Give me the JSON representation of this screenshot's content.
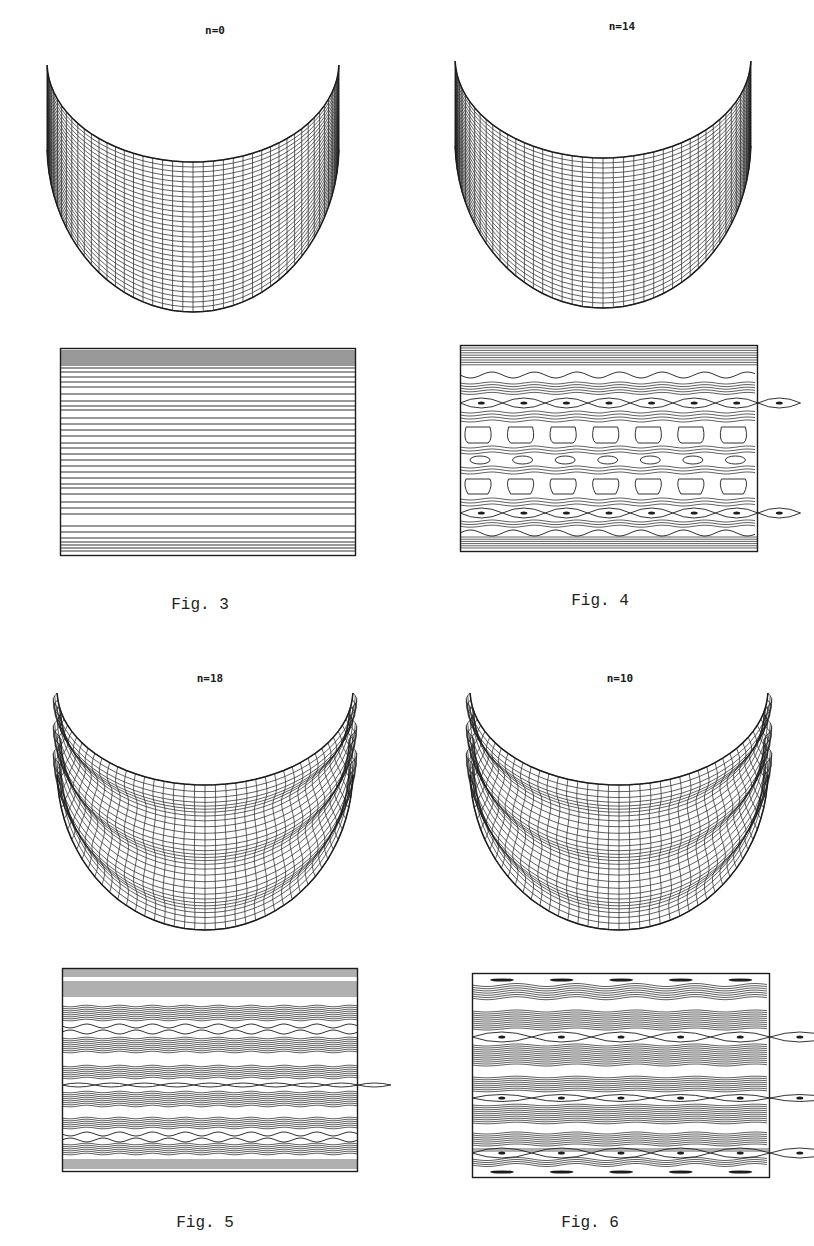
{
  "figures": [
    {
      "id": "fig3",
      "caption": "Fig. 3",
      "mesh_label": "n=0",
      "wave_number": 0,
      "mesh": {
        "x": 47,
        "y": 62,
        "w": 292,
        "inner_depth": 100,
        "outer_depth": 250,
        "ridges": 0
      },
      "contour_box": {
        "x": 60,
        "y": 348,
        "w": 296,
        "h": 208
      },
      "contour_style": "uniform-horizontal",
      "caption_pos": {
        "x": 130,
        "y": 596
      },
      "label_pos": {
        "x": 155,
        "y": 24
      }
    },
    {
      "id": "fig4",
      "caption": "Fig. 4",
      "mesh_label": "n=14",
      "wave_number": 14,
      "mesh": {
        "x": 455,
        "y": 58,
        "w": 296,
        "inner_depth": 100,
        "outer_depth": 250,
        "ridges": 0
      },
      "contour_box": {
        "x": 460,
        "y": 345,
        "w": 298,
        "h": 207
      },
      "contour_style": "cells",
      "caption_pos": {
        "x": 530,
        "y": 592
      },
      "label_pos": {
        "x": 562,
        "y": 20
      }
    },
    {
      "id": "fig5",
      "caption": "Fig. 5",
      "mesh_label": "n=18",
      "wave_number": 18,
      "mesh": {
        "x": 57,
        "y": 690,
        "w": 296,
        "inner_depth": 95,
        "outer_depth": 240,
        "ridges": 3
      },
      "contour_box": {
        "x": 62,
        "y": 968,
        "w": 296,
        "h": 204
      },
      "contour_style": "bands-small-eyes",
      "caption_pos": {
        "x": 135,
        "y": 1214
      },
      "label_pos": {
        "x": 150,
        "y": 672
      }
    },
    {
      "id": "fig6",
      "caption": "Fig. 6",
      "mesh_label": "n=10",
      "wave_number": 10,
      "mesh": {
        "x": 470,
        "y": 690,
        "w": 298,
        "inner_depth": 95,
        "outer_depth": 240,
        "ridges": 3
      },
      "contour_box": {
        "x": 472,
        "y": 973,
        "w": 298,
        "h": 205
      },
      "contour_style": "bands-large-eyes",
      "caption_pos": {
        "x": 520,
        "y": 1214
      },
      "label_pos": {
        "x": 560,
        "y": 672
      }
    }
  ],
  "colors": {
    "ink": "#1c1c1c",
    "paper": "#ffffff"
  }
}
